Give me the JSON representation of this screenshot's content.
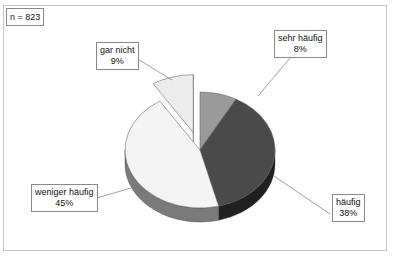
{
  "chart_data": {
    "type": "pie",
    "style": "3d-exploded",
    "title": "",
    "annotation": "n = 823",
    "slices": [
      {
        "label": "sehr häufig",
        "value": 8,
        "display": "8%",
        "color": "#9a9a9a",
        "side": "#6e6e6e",
        "exploded": false
      },
      {
        "label": "häufig",
        "value": 38,
        "display": "38%",
        "color": "#4a4a4a",
        "side": "#202020",
        "exploded": false
      },
      {
        "label": "weniger häufig",
        "value": 45,
        "display": "45%",
        "color": "#f4f4f4",
        "side": "#7a7a7a",
        "exploded": false
      },
      {
        "label": "gar nicht",
        "value": 9,
        "display": "9%",
        "color": "#ececec",
        "side": "#555555",
        "exploded": true
      }
    ]
  },
  "labels": {
    "n": "n = 823",
    "sehr_haeufig": [
      "sehr häufig",
      "8%"
    ],
    "haeufig": [
      "häufig",
      "38%"
    ],
    "weniger": [
      "weniger häufig",
      "45%"
    ],
    "gar_nicht": [
      "gar nicht",
      "9%"
    ]
  }
}
